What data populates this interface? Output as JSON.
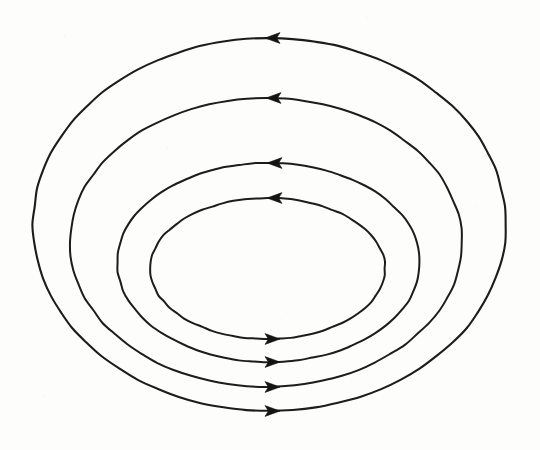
{
  "figure": {
    "background_color": "#fdfdfc",
    "stroke_color": "#1c1c1c",
    "arrow_color": "#141414",
    "canvas": {
      "width": 540,
      "height": 450
    }
  },
  "chart_data": {
    "type": "diagram",
    "subtype": "vector-field-loops",
    "title": "",
    "xlabel": "",
    "ylabel": "",
    "grid": false,
    "legend": null,
    "axis_ranges": {
      "x": [
        0,
        540
      ],
      "y": [
        0,
        450
      ]
    },
    "loops": [
      {
        "id": "loop-1-innermost",
        "label": "innermost loop",
        "cx": 267.5,
        "cy": 268.5,
        "rx": 117.5,
        "ry": 70.5,
        "stroke_width": 2.0,
        "direction": "counterclockwise",
        "arrows": [
          {
            "position": "top",
            "x": 267,
            "y": 198,
            "points": "left"
          },
          {
            "position": "bottom",
            "x": 280,
            "y": 339,
            "points": "right"
          }
        ]
      },
      {
        "id": "loop-2",
        "label": "second loop",
        "cx": 268.5,
        "cy": 262.5,
        "rx": 151.5,
        "ry": 99.5,
        "stroke_width": 2.0,
        "direction": "counterclockwise",
        "arrows": [
          {
            "position": "top",
            "x": 267,
            "y": 163,
            "points": "left"
          },
          {
            "position": "bottom",
            "x": 280,
            "y": 362,
            "points": "right"
          }
        ]
      },
      {
        "id": "loop-3",
        "label": "third loop",
        "cx": 266.0,
        "cy": 242.5,
        "rx": 196.0,
        "ry": 144.5,
        "stroke_width": 2.0,
        "direction": "counterclockwise",
        "arrows": [
          {
            "position": "top",
            "x": 266,
            "y": 98,
            "points": "left"
          },
          {
            "position": "bottom",
            "x": 280,
            "y": 387,
            "points": "right"
          }
        ]
      },
      {
        "id": "loop-4-outermost",
        "label": "outermost loop",
        "cx": 269.5,
        "cy": 224.5,
        "rx": 236.5,
        "ry": 186.5,
        "stroke_width": 2.1,
        "direction": "counterclockwise",
        "arrows": [
          {
            "position": "top",
            "x": 265,
            "y": 38,
            "points": "left"
          },
          {
            "position": "bottom",
            "x": 280,
            "y": 411,
            "points": "right"
          }
        ]
      }
    ],
    "arrow_summary": {
      "top_arrows_direction": "left",
      "bottom_arrows_direction": "right",
      "total_arrows": 8,
      "loop_count": 4
    },
    "annotations": []
  }
}
